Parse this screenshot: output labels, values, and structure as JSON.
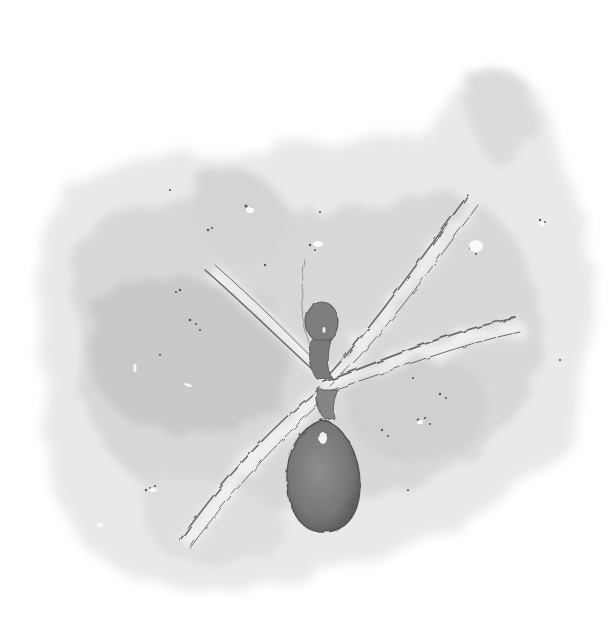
{
  "artwork": {
    "subject": "watercolor spider",
    "caption": "Grayscale watercolor painting of a spider with long thin legs on a mottled gray wash background",
    "palette": {
      "paper": "#ffffff",
      "wash_light": "#e6e6e6",
      "wash_mid": "#cfcfcf",
      "wash_dark": "#b2b2b2",
      "body": "#7a7a7a",
      "body_dark": "#5e5e5e",
      "leg_edge": "#6b6b6b",
      "speckle": "#555555"
    }
  }
}
